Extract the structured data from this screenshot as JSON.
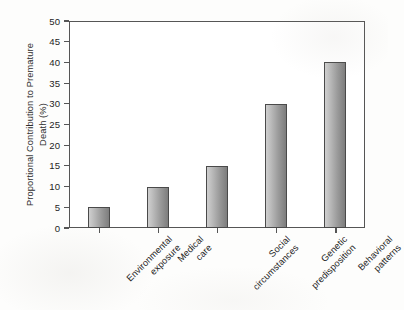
{
  "chart_data": {
    "type": "bar",
    "title": "",
    "xlabel": "",
    "ylabel": "Proportional Contribution to Premature Death (%)",
    "ylabel_lines": [
      "Proportional Contribution to Premature",
      "Death (%)"
    ],
    "categories": [
      "Environmental exposure",
      "Medical care",
      "Social circumstances",
      "Genetic predisposition",
      "Behavioral patterns"
    ],
    "category_lines": [
      [
        "Environmental",
        "exposure"
      ],
      [
        "Medical",
        "care"
      ],
      [
        "Social",
        "circumstances"
      ],
      [
        "Genetic",
        "predisposition"
      ],
      [
        "Behavioral",
        "patterns"
      ]
    ],
    "values": [
      5,
      10,
      15,
      30,
      40
    ],
    "ylim": [
      0,
      50
    ],
    "ytick_step": 5,
    "yticks": [
      0,
      5,
      10,
      15,
      20,
      25,
      30,
      35,
      40,
      45,
      50
    ],
    "ytick_labels": [
      "0",
      "5",
      "10",
      "15",
      "20",
      "25",
      "30",
      "35",
      "40",
      "45",
      "50"
    ],
    "grid": false,
    "legend": false,
    "legend_position": "none",
    "bar_fill_light": "#cfcfcf",
    "bar_fill_dark": "#7d7d7d",
    "bar_border_color": "#4a4a4a",
    "axis_color": "#555555",
    "text_color": "#242424",
    "plot_background": "#ffffff",
    "page_background": "#fdfdfc"
  }
}
